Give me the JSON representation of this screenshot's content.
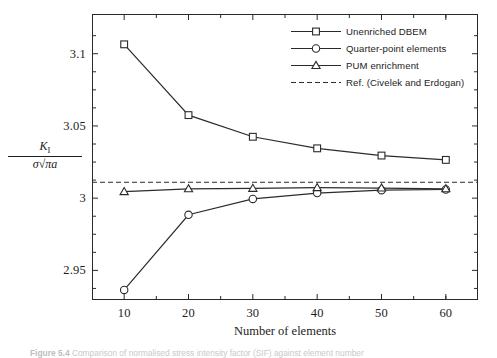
{
  "figure": {
    "caption_prefix": "Figure 5.4",
    "caption_text": "Comparison of normalised stress intensity factor (SIF) against element number"
  },
  "axes": {
    "x_title": "Number of elements",
    "y_title_numerator": "K",
    "y_title_numerator_sub": "I",
    "y_title_denominator_sigma": "σ",
    "y_title_denominator_radical": "√",
    "y_title_denominator_arg": "πa",
    "x_ticks": [
      "10",
      "20",
      "30",
      "40",
      "50",
      "60"
    ],
    "y_ticks": [
      "3.1",
      "3.05",
      "3",
      "2.95"
    ]
  },
  "legend": {
    "items": [
      {
        "label": "Unenriched DBEM",
        "marker": "square-marker",
        "style": "solid"
      },
      {
        "label": "Quarter-point elements",
        "marker": "circle-marker",
        "style": "solid"
      },
      {
        "label": "PUM enrichment",
        "marker": "triangle-marker",
        "style": "solid"
      },
      {
        "label": "Ref. (Civelek and Erdogan)",
        "marker": "none",
        "style": "dashed"
      }
    ]
  },
  "chart_data": {
    "type": "line",
    "title": "",
    "xlabel": "Number of elements",
    "ylabel": "K_I / (sigma*sqrt(pi*a))",
    "x": [
      10,
      20,
      30,
      40,
      50,
      60
    ],
    "xlim": [
      5,
      65
    ],
    "ylim": [
      2.9295,
      3.1275
    ],
    "grid": false,
    "legend_position": "top-right",
    "series": [
      {
        "name": "Unenriched DBEM",
        "marker": "square",
        "style": "solid",
        "values": [
          3.1065,
          3.0575,
          3.0425,
          3.0345,
          3.0295,
          3.0265
        ]
      },
      {
        "name": "Quarter-point elements",
        "marker": "circle",
        "style": "solid",
        "values": [
          2.9365,
          2.9885,
          2.9995,
          3.0035,
          3.0055,
          3.006
        ]
      },
      {
        "name": "PUM enrichment",
        "marker": "triangle",
        "style": "solid",
        "values": [
          3.0045,
          3.0065,
          3.0068,
          3.0073,
          3.007,
          3.0065
        ]
      }
    ],
    "reference_line": {
      "name": "Ref. (Civelek and Erdogan)",
      "style": "dashed",
      "value": 3.011
    }
  },
  "colors": {
    "line": "#2b2b2b",
    "frame": "#2b2b2b",
    "text": "#1c1c1c",
    "background": "#ffffff"
  }
}
